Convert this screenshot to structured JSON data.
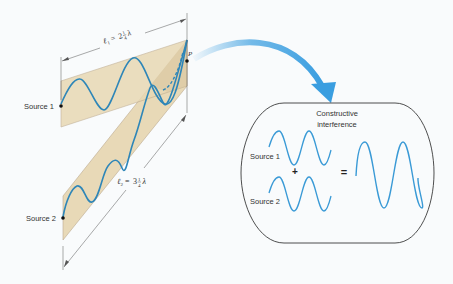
{
  "diagram": {
    "colors": {
      "background": "#f9fbfc",
      "band_fill": "#e8d8b4",
      "band_stroke": "#b8a68a",
      "wave": "#2e86b8",
      "wave_light": "#3a9ad6",
      "arrow": "#3a9ee0",
      "outline": "#333333"
    },
    "sources": [
      {
        "label": "Source 1"
      },
      {
        "label": "Source 2"
      }
    ],
    "point_label": "P",
    "path_lengths": [
      {
        "symbol": "ℓ",
        "subscript": "1",
        "whole": "2",
        "num": "1",
        "den": "4",
        "unit": "λ"
      },
      {
        "symbol": "ℓ",
        "subscript": "2",
        "whole": "3",
        "num": "1",
        "den": "4",
        "unit": "λ"
      }
    ],
    "inset": {
      "title_line1": "Constructive",
      "title_line2": "interference",
      "source1_label": "Source 1",
      "source2_label": "Source 2",
      "plus": "+",
      "equals": "="
    }
  }
}
